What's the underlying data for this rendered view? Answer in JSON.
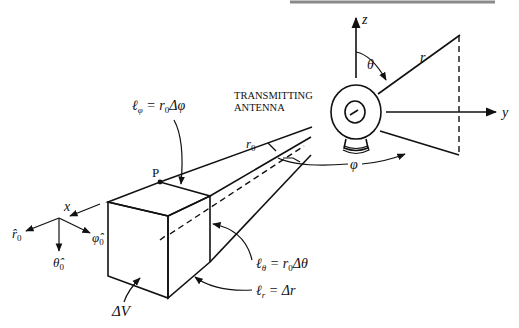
{
  "figure": {
    "type": "diagram",
    "top_rule_color": "#7a7a7a",
    "ink_color": "#111111"
  },
  "labels": {
    "antenna": [
      "TRANSMITTING",
      "ANTENNA"
    ],
    "z_axis": "z",
    "y_axis": "y",
    "x_axis": "x",
    "theta": "θ",
    "phi": "φ",
    "r": "r",
    "r0": "r",
    "r0_sub": "0",
    "point_p": "P",
    "l_phi": "ℓ",
    "l_phi_sub": "φ",
    "l_phi_eq": " = r",
    "l_phi_eq_sub": "0",
    "l_phi_eq_end": "Δφ",
    "l_theta": "ℓ",
    "l_theta_sub": "θ",
    "l_theta_eq": " = r",
    "l_theta_eq_sub": "0",
    "l_theta_eq_end": "Δθ",
    "l_r": "ℓ",
    "l_r_sub": "r",
    "l_r_eq": " = Δr",
    "delta_v": "ΔV",
    "r_hat": "r̂",
    "r_hat_sub": "0",
    "theta_hat": "θ̂",
    "theta_hat_sub": "0",
    "phi_hat": "φ̂",
    "phi_hat_sub": "0"
  }
}
